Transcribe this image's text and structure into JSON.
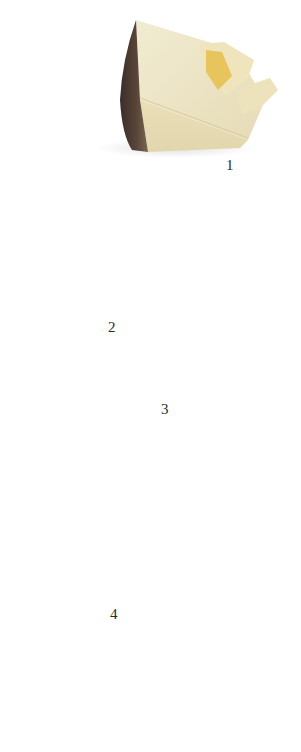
{
  "figure": {
    "background": "#ffffff",
    "items": [
      {
        "number": "1",
        "subject": "hard cheese wedge with dark rind and broken crumbs",
        "colors": {
          "paste": "#ece5c6",
          "rind": "#4a3a33",
          "crumb": "#e8c860"
        }
      },
      {
        "number": "2",
        "subject": "long cheese wedge with brown rind and small eyes",
        "colors": {
          "paste": "#efe6c8",
          "rind": "#7a5f45"
        }
      },
      {
        "number": "3",
        "subject": "Emmental-style cheese block with holes and orange-brown rind",
        "colors": {
          "paste": "#efe9cf",
          "rind": "#c88a4e"
        }
      },
      {
        "number": "4",
        "subject": "smoked pear-shaped cheeses, one sliced open",
        "colors": {
          "skin": "#c07a34",
          "skin_light": "#e0a45c",
          "cut": "#f2e6c4"
        }
      }
    ]
  }
}
